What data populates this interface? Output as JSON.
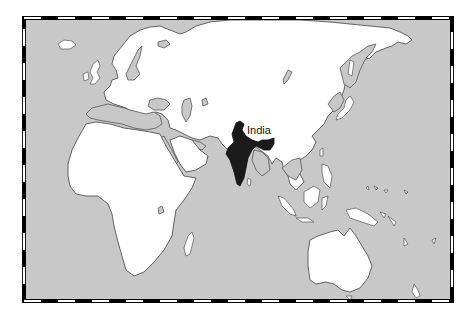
{
  "map": {
    "type": "world-map-eastern-hemisphere",
    "highlighted_country": "India",
    "labels": [
      {
        "text": "India",
        "x": 247,
        "y": 134
      }
    ],
    "colors": {
      "ocean": "#c8c8c8",
      "land": "#ffffff",
      "highlight": "#1a1a1a",
      "border": "#555555",
      "frame_dark": "#000000",
      "frame_light": "#ffffff"
    },
    "frame": {
      "style": "alternating-dash",
      "left": 24,
      "top": 18,
      "right": 452,
      "bottom": 301
    }
  }
}
